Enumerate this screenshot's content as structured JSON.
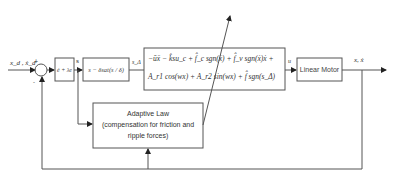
{
  "diagram": {
    "input_label": "x_d , ẋ_d",
    "summing_junction": {
      "plus_label": "+",
      "minus_label": "-"
    },
    "blocks": {
      "error_filter": {
        "label": "ė + λe"
      },
      "saturation": {
        "label": "s − δsat(s / δ)"
      },
      "controller": {
        "line1": "−ūẍ − k̂su_c + f̂_c sgn(ẋ) + f̂_v sgn(ẋ)ẋ +",
        "line2": "A_r1 cos(wx) + A_r2 sin(wx) + f̂ sgn(s_Δ)"
      },
      "plant": {
        "label": "Linear Motor"
      },
      "adaptive_law": {
        "line1": "Adaptive Law",
        "line2": "(compensation for friction and",
        "line3": "ripple forces)"
      }
    },
    "signals": {
      "s": "s",
      "s_delta": "s_Δ",
      "u": "u",
      "output": "x, ẋ"
    },
    "colors": {
      "line": "#555555",
      "box_border": "#666666",
      "text": "#333333"
    }
  }
}
